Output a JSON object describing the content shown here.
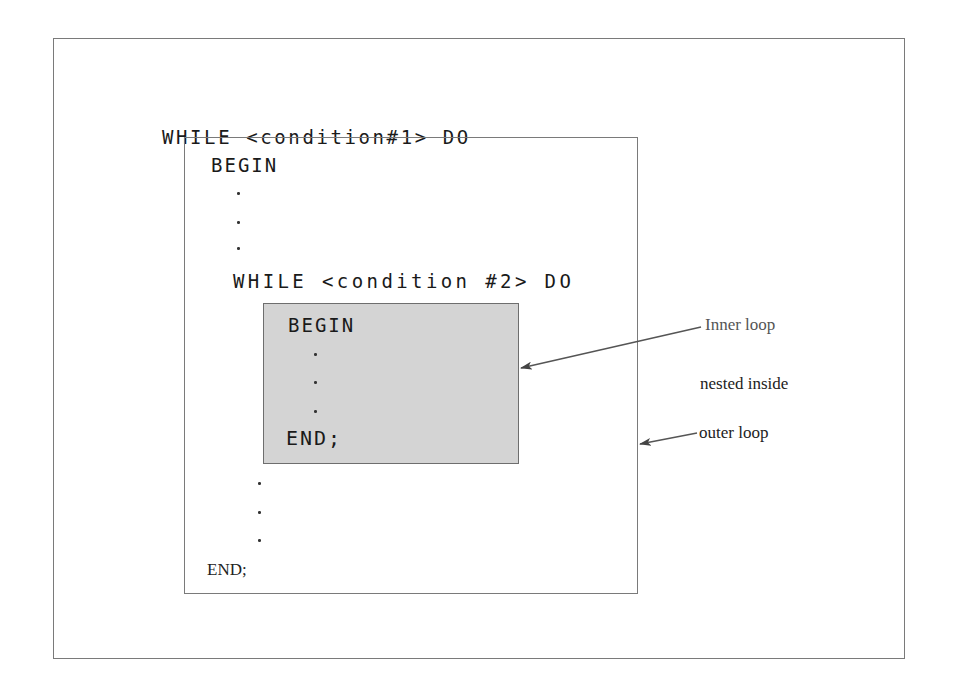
{
  "diagram": {
    "outer_loop": {
      "header": "WHILE <condition#1> DO",
      "begin": "BEGIN",
      "end": "END;"
    },
    "inner_loop": {
      "header": "WHILE <condition #2> DO",
      "begin": "BEGIN",
      "end": "END;"
    },
    "ellipsis_dot": ".",
    "annotations": {
      "inner_loop_label": "Inner loop",
      "nested_inside_label": "nested inside",
      "outer_loop_label": "outer loop"
    },
    "colors": {
      "inner_box_fill": "#d4d4d4",
      "border": "#7a7a7a",
      "inner_label": "#555555",
      "text": "#1a1a1a"
    }
  }
}
